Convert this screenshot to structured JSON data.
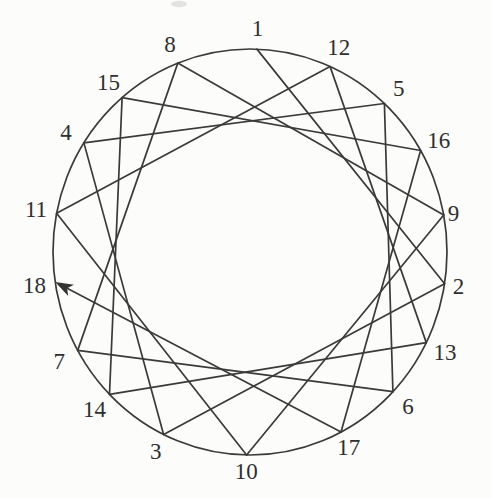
{
  "figure": {
    "background": "#fcfcfb",
    "stroke_color": "#3a3a3a",
    "label_color": "#2f2f2f",
    "arrow_color": "#333333",
    "stroke_width": 1.7,
    "font_size": 23,
    "geometry": {
      "cx": 250,
      "cy": 252,
      "rx": 197,
      "ry": 203,
      "label_pad": 21,
      "arrow_length": 18,
      "arrow_half_width": 6.3,
      "arrow_notch": 13.5
    },
    "points_clockwise_from_top": [
      {
        "label": "1",
        "angle": 88
      },
      {
        "label": "12",
        "angle": 66
      },
      {
        "label": "5",
        "angle": 47
      },
      {
        "label": "16",
        "angle": 30
      },
      {
        "label": "9",
        "angle": 10.5,
        "label_pad": 10
      },
      {
        "label": "2",
        "angle": -9,
        "label_pad": 14
      },
      {
        "label": "13",
        "angle": -26.5
      },
      {
        "label": "6",
        "angle": -43.5
      },
      {
        "label": "17",
        "angle": -62.5,
        "label_pad": 17
      },
      {
        "label": "10",
        "angle": -91,
        "label_pad": 16
      },
      {
        "label": "3",
        "angle": -116,
        "label_pad": 18
      },
      {
        "label": "14",
        "angle": -135.5
      },
      {
        "label": "7",
        "angle": -151
      },
      {
        "label": "18",
        "angle": -171.5
      },
      {
        "label": "11",
        "angle": 169
      },
      {
        "label": "4",
        "angle": 147.5
      },
      {
        "label": "15",
        "angle": 130.5
      },
      {
        "label": "8",
        "angle": 111.5
      }
    ],
    "chord_sequence": [
      "1",
      "2",
      "3",
      "4",
      "5",
      "6",
      "7",
      "8",
      "9",
      "10",
      "11",
      "12",
      "13",
      "14",
      "15",
      "16",
      "17",
      "18"
    ],
    "arrow_at_end_of_chord": [
      "17",
      "18"
    ],
    "artifacts": [
      {
        "type": "scan-smudge",
        "x": 179,
        "y": 4,
        "rx": 8,
        "ry": 3.2,
        "color": "#c6c6c6",
        "opacity": 0.45
      }
    ]
  }
}
